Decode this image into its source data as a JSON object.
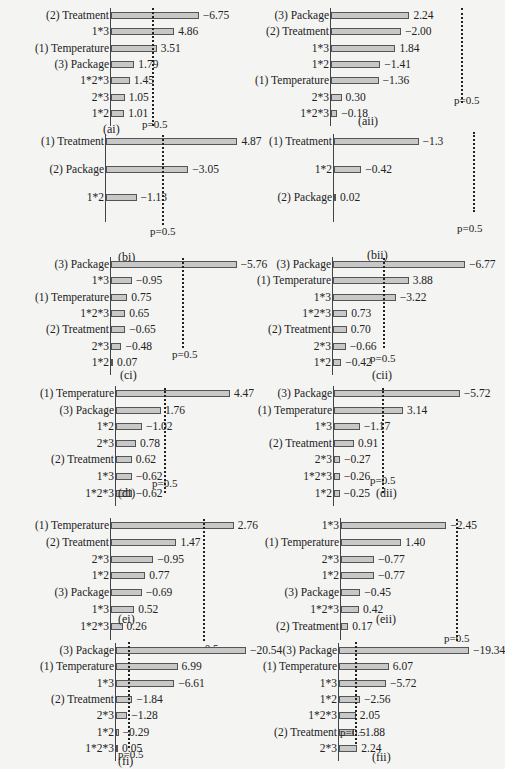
{
  "chart_data": [
    {
      "id": "ai",
      "type": "bar",
      "orientation": "horizontal",
      "caption": "(ai)",
      "threshold_label": "p=0.5",
      "threshold": 0.5,
      "categories": [
        "(2) Treatment",
        "1*3",
        "(1) Temperature",
        "(3) Package",
        "1*2*3",
        "2*3",
        "1*2"
      ],
      "values": [
        6.75,
        4.86,
        3.51,
        1.79,
        1.45,
        1.05,
        1.01
      ],
      "labels": [
        "−6.75",
        "4.86",
        "3.51",
        "1.79",
        "1.45",
        "1.05",
        "1.01"
      ]
    },
    {
      "id": "aii",
      "type": "bar",
      "orientation": "horizontal",
      "caption": "(aii)",
      "threshold_label": "p=0.5",
      "threshold": 0.5,
      "categories": [
        "(3) Package",
        "(2) Treatment",
        "1*3",
        "1*2",
        "(1) Temperature",
        "2*3",
        "1*2*3"
      ],
      "values": [
        2.24,
        -2.0,
        1.84,
        -1.41,
        -1.36,
        0.3,
        -0.18
      ],
      "labels": [
        "2.24",
        "−2.00",
        "1.84",
        "−1.41",
        "−1.36",
        "0.30",
        "−0.18"
      ]
    },
    {
      "id": "bi",
      "type": "bar",
      "orientation": "horizontal",
      "caption": "(bi)",
      "threshold_label": "p=0.5",
      "threshold": 0.5,
      "categories": [
        "(1) Treatment",
        "(2) Package",
        "1*2"
      ],
      "values": [
        4.87,
        -3.05,
        -1.13
      ],
      "labels": [
        "4.87",
        "−3.05",
        "−1.13"
      ]
    },
    {
      "id": "bii",
      "type": "bar",
      "orientation": "horizontal",
      "caption": "(bii)",
      "threshold_label": "p=0.5",
      "threshold": 0.5,
      "categories": [
        "(1) Treatment",
        "1*2",
        "(2) Package"
      ],
      "values": [
        -1.3,
        -0.42,
        0.02
      ],
      "labels": [
        "−1.3",
        "−0.42",
        "0.02"
      ]
    },
    {
      "id": "ci",
      "type": "bar",
      "orientation": "horizontal",
      "caption": "(ci)",
      "threshold_label": "p=0.5",
      "threshold": 0.5,
      "categories": [
        "(3) Package",
        "1*3",
        "(1) Temperature",
        "1*2*3",
        "(2) Treatment",
        "2*3",
        "1*2"
      ],
      "values": [
        -5.76,
        -0.95,
        0.75,
        0.65,
        -0.65,
        -0.48,
        0.07
      ],
      "labels": [
        "−5.76",
        "−0.95",
        "0.75",
        "0.65",
        "−0.65",
        "−0.48",
        "0.07"
      ]
    },
    {
      "id": "cii",
      "type": "bar",
      "orientation": "horizontal",
      "caption": "(cii)",
      "threshold_label": "p=0.5",
      "threshold": 0.5,
      "categories": [
        "(3) Package",
        "(1) Temperature",
        "1*3",
        "1*2*3",
        "(2) Treatment",
        "2*3",
        "1*2"
      ],
      "values": [
        -6.77,
        3.88,
        -3.22,
        0.73,
        0.7,
        -0.66,
        -0.42
      ],
      "labels": [
        "−6.77",
        "3.88",
        "−3.22",
        "0.73",
        "0.70",
        "−0.66",
        "−0.42"
      ]
    },
    {
      "id": "di",
      "type": "bar",
      "orientation": "horizontal",
      "caption": "(di)",
      "threshold_label": "p=0.5",
      "threshold": 0.5,
      "categories": [
        "(1) Temperature",
        "(3) Package",
        "1*2",
        "2*3",
        "(2) Treatment",
        "1*3",
        "1*2*3"
      ],
      "values": [
        4.47,
        1.76,
        -1.02,
        0.78,
        0.62,
        -0.62,
        -0.62
      ],
      "labels": [
        "4.47",
        "1.76",
        "−1.02",
        "0.78",
        "0.62",
        "−0.62",
        "−0.62"
      ]
    },
    {
      "id": "dii",
      "type": "bar",
      "orientation": "horizontal",
      "caption": "(dii)",
      "threshold_label": "p=0.5",
      "threshold": 0.5,
      "categories": [
        "(3) Package",
        "(1) Temperature",
        "1*3",
        "(2) Treatment",
        "2*3",
        "1*2*3",
        "1*2"
      ],
      "values": [
        -5.72,
        3.14,
        -1.17,
        0.91,
        -0.27,
        -0.26,
        -0.25
      ],
      "labels": [
        "−5.72",
        "3.14",
        "−1.17",
        "0.91",
        "−0.27",
        "−0.26",
        "−0.25"
      ]
    },
    {
      "id": "ei",
      "type": "bar",
      "orientation": "horizontal",
      "caption": "(ei)",
      "threshold_label": "p=0.5",
      "threshold": 0.5,
      "categories": [
        "(1) Temperature",
        "(2) Treatment",
        "2*3",
        "1*2",
        "(3) Package",
        "1*3",
        "1*2*3"
      ],
      "values": [
        2.76,
        1.47,
        -0.95,
        0.77,
        -0.69,
        0.52,
        0.26
      ],
      "labels": [
        "2.76",
        "1.47",
        "−0.95",
        "0.77",
        "−0.69",
        "0.52",
        "0.26"
      ]
    },
    {
      "id": "eii",
      "type": "bar",
      "orientation": "horizontal",
      "caption": "(eii)",
      "threshold_label": "p=0.5",
      "threshold": 0.5,
      "categories": [
        "1*3",
        "(1) Temperature",
        "2*3",
        "1*2",
        "(3) Package",
        "1*2*3",
        "(2) Treatment"
      ],
      "values": [
        -2.45,
        1.4,
        -0.77,
        -0.77,
        -0.45,
        0.42,
        0.17
      ],
      "labels": [
        "−2.45",
        "1.40",
        "−0.77",
        "−0.77",
        "−0.45",
        "0.42",
        "0.17"
      ]
    },
    {
      "id": "fi",
      "type": "bar",
      "orientation": "horizontal",
      "caption": "(fi)",
      "threshold_label": "p=0.5",
      "threshold": 0.5,
      "categories": [
        "(3) Package",
        "(1) Temperature",
        "1*3",
        "(2) Treatment",
        "2*3",
        "1*2",
        "1*2*3"
      ],
      "values": [
        -20.54,
        6.99,
        -6.61,
        -1.84,
        -1.28,
        -0.29,
        0.05
      ],
      "labels": [
        "−20.54",
        "6.99",
        "−6.61",
        "−1.84",
        "−1.28",
        "−0.29",
        "0.05"
      ]
    },
    {
      "id": "fii",
      "type": "bar",
      "orientation": "horizontal",
      "caption": "(fii)",
      "threshold_label": "p=0.5",
      "threshold": 0.5,
      "categories": [
        "(3) Package",
        "(1) Temperature",
        "1*3",
        "1*2",
        "1*2*3",
        "(2) Treatment",
        "2*3"
      ],
      "values": [
        -19.34,
        6.07,
        -5.72,
        -2.56,
        2.05,
        -1.88,
        2.24
      ],
      "labels": [
        "−19.34",
        "6.07",
        "−5.72",
        "−2.56",
        "2.05",
        "−1.88",
        "2.24"
      ]
    }
  ]
}
